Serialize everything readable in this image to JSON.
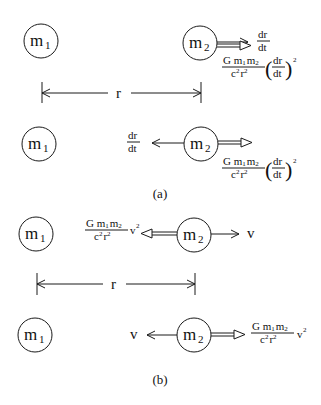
{
  "diagram": {
    "colors": {
      "ink": "#1a1a1a",
      "background": "#ffffff"
    },
    "panels": [
      {
        "caption": "(a)",
        "scenes": [
          {
            "m1": {
              "label": "m",
              "subscript": "1"
            },
            "m2": {
              "label": "m",
              "subscript": "2"
            },
            "velocity": {
              "direction": "right",
              "num": "dr",
              "den": "dt"
            },
            "force": {
              "direction": "right",
              "num_G": "G m",
              "num_sub1": "1",
              "num_m": "m",
              "num_sub2": "2",
              "den": "c",
              "den_sup1": "2",
              "den_r": "r",
              "den_sup2": "2",
              "factor_num": "dr",
              "factor_den": "dt",
              "exponent": "2"
            }
          },
          {
            "m1": {
              "label": "m",
              "subscript": "1"
            },
            "m2": {
              "label": "m",
              "subscript": "2"
            },
            "velocity": {
              "direction": "left",
              "num": "dr",
              "den": "dt"
            },
            "force": {
              "direction": "right",
              "num_G": "G m",
              "num_sub1": "1",
              "num_m": "m",
              "num_sub2": "2",
              "den": "c",
              "den_sup1": "2",
              "den_r": "r",
              "den_sup2": "2",
              "factor_num": "dr",
              "factor_den": "dt",
              "exponent": "2"
            }
          }
        ],
        "separation_label": "r"
      },
      {
        "caption": "(b)",
        "scenes": [
          {
            "m1": {
              "label": "m",
              "subscript": "1"
            },
            "m2": {
              "label": "m",
              "subscript": "2"
            },
            "velocity": {
              "direction": "right",
              "label": "v"
            },
            "force": {
              "direction": "left",
              "num_G": "G m",
              "num_sub1": "1",
              "num_m": "m",
              "num_sub2": "2",
              "den": "c",
              "den_sup1": "2",
              "den_r": "r",
              "den_sup2": "2",
              "factor": "v",
              "exponent": "2"
            }
          },
          {
            "m1": {
              "label": "m",
              "subscript": "1"
            },
            "m2": {
              "label": "m",
              "subscript": "2"
            },
            "velocity": {
              "direction": "left",
              "label": "v"
            },
            "force": {
              "direction": "right",
              "num_G": "G m",
              "num_sub1": "1",
              "num_m": "m",
              "num_sub2": "2",
              "den": "c",
              "den_sup1": "2",
              "den_r": "r",
              "den_sup2": "2",
              "factor": "v",
              "exponent": "2"
            }
          }
        ],
        "separation_label": "r"
      }
    ]
  }
}
